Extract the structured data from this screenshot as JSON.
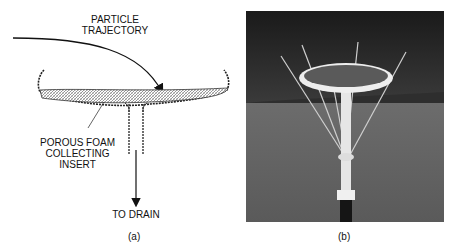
{
  "panel_a": {
    "label_trajectory": "PARTICLE\nTRAJECTORY",
    "label_foam": "POROUS FOAM\nCOLLECTING\nINSERT",
    "label_drain": "TO DRAIN",
    "caption": "(a)"
  },
  "panel_b": {
    "caption": "(b)",
    "photo_description": "Collector dish mounted on a pole with radiating wire spikes, set on grass in front of bushes"
  }
}
